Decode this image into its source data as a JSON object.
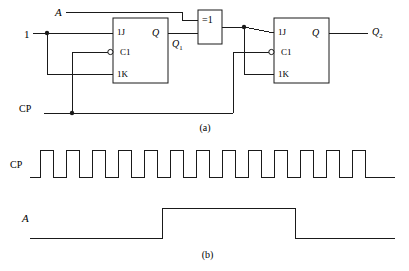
{
  "figure": {
    "caption_a": "(a)",
    "caption_b": "(b)"
  },
  "circuit": {
    "inputs": {
      "a_label": "A",
      "one_label": "1",
      "cp_label": "CP"
    },
    "xor_gate": {
      "label": "=1"
    },
    "flipflop1": {
      "j_label": "1J",
      "clk_label": "C1",
      "k_label": "1K",
      "q_label": "Q",
      "output_label": "Q",
      "output_sub": "1"
    },
    "flipflop2": {
      "j_label": "1J",
      "clk_label": "C1",
      "k_label": "1K",
      "q_label": "Q",
      "output_label": "Q",
      "output_sub": "2"
    }
  },
  "timing": {
    "cp_label": "CP",
    "a_label": "A",
    "cp_pulse_count": 13,
    "cp_start_x": 30,
    "cp_period": 26,
    "cp_high_width": 13,
    "cp_high_y": 150,
    "cp_low_y": 177,
    "cp_end_x": 395,
    "a_start_x": 30,
    "a_rise_x": 162,
    "a_fall_x": 295,
    "a_end_x": 395,
    "a_high_y": 208,
    "a_low_y": 238
  },
  "style": {
    "line_color": "#1a1a1a",
    "line_width": 1.0,
    "background": "#ffffff"
  }
}
